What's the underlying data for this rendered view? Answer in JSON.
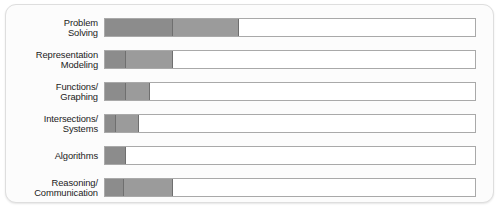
{
  "chart_data": {
    "type": "bar",
    "title": "",
    "subtitle": "",
    "xlabel": "",
    "ylabel": "",
    "orientation": "horizontal",
    "stacked": true,
    "grid": false,
    "legend": "none",
    "xlim": [
      0,
      100
    ],
    "axis_visible": false,
    "tick_labels": [],
    "categories": [
      "Problem\nSolving",
      "Representation\nModeling",
      "Functions/\nGraphing",
      "Intersections/\nSystems",
      "Algorithms",
      "Reasoning/\nCommunication"
    ],
    "series": [
      {
        "name": "segment-1",
        "color": "#8c8c8c",
        "values": [
          18.5,
          5.6,
          5.6,
          3.0,
          5.6,
          5.1
        ]
      },
      {
        "name": "segment-2",
        "color": "#9b9b9b",
        "values": [
          17.8,
          12.9,
          6.5,
          6.1,
          0,
          13.4
        ]
      }
    ],
    "totals": [
      36.3,
      18.5,
      12.1,
      9.1,
      5.6,
      18.5
    ]
  },
  "panel": {
    "background_color": "#fcfcfc",
    "border_color": "#dedede",
    "track_border_color": "#a9a9a9",
    "track_fill_color": "#ffffff"
  }
}
